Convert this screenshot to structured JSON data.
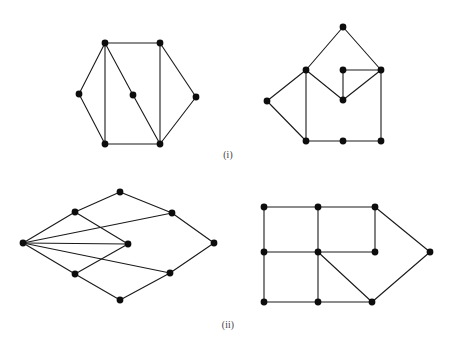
{
  "figure": {
    "background_color": "#ffffff",
    "edge_color": "#1a1a1a",
    "vertex_color": "#0d0d0d",
    "edge_width": 1.1,
    "vertex_radius": 3.4,
    "captions": {
      "first": "(i)",
      "second": "(ii)"
    }
  },
  "chart_data": {
    "type": "diagram",
    "title": "",
    "graphs": [
      {
        "id": "graph-i-left",
        "row": "i",
        "position": "left",
        "name": "hexagon-with-central-vertex",
        "vertex_count": 7,
        "edge_count": 10,
        "vertices": [
          {
            "id": "v1",
            "x": 105,
            "y": 43
          },
          {
            "id": "v2",
            "x": 160,
            "y": 43
          },
          {
            "id": "v3",
            "x": 196,
            "y": 97
          },
          {
            "id": "v4",
            "x": 160,
            "y": 144
          },
          {
            "id": "v5",
            "x": 105,
            "y": 144
          },
          {
            "id": "v6",
            "x": 79,
            "y": 94
          },
          {
            "id": "v7",
            "x": 133,
            "y": 95
          }
        ],
        "edges": [
          [
            "v1",
            "v2"
          ],
          [
            "v2",
            "v3"
          ],
          [
            "v3",
            "v4"
          ],
          [
            "v4",
            "v5"
          ],
          [
            "v5",
            "v6"
          ],
          [
            "v6",
            "v1"
          ],
          [
            "v1",
            "v5"
          ],
          [
            "v2",
            "v4"
          ],
          [
            "v1",
            "v7"
          ],
          [
            "v7",
            "v4"
          ]
        ]
      },
      {
        "id": "graph-i-right",
        "row": "i",
        "position": "right",
        "name": "tilted-square-with-interior-vee",
        "vertex_count": 8,
        "edge_count": 11,
        "vertices": [
          {
            "id": "w1",
            "x": 343,
            "y": 27
          },
          {
            "id": "w2",
            "x": 306,
            "y": 70
          },
          {
            "id": "w3",
            "x": 267,
            "y": 101
          },
          {
            "id": "w4",
            "x": 306,
            "y": 141
          },
          {
            "id": "w5",
            "x": 343,
            "y": 141
          },
          {
            "id": "w6",
            "x": 381,
            "y": 141
          },
          {
            "id": "w7",
            "x": 381,
            "y": 70
          },
          {
            "id": "w8",
            "x": 343,
            "y": 100
          },
          {
            "id": "w9",
            "x": 343,
            "y": 70
          }
        ],
        "edges": [
          [
            "w1",
            "w2"
          ],
          [
            "w1",
            "w7"
          ],
          [
            "w2",
            "w3"
          ],
          [
            "w3",
            "w4"
          ],
          [
            "w2",
            "w4"
          ],
          [
            "w4",
            "w5"
          ],
          [
            "w5",
            "w6"
          ],
          [
            "w6",
            "w7"
          ],
          [
            "w2",
            "w8"
          ],
          [
            "w8",
            "w7"
          ],
          [
            "w8",
            "w9"
          ],
          [
            "w9",
            "w7"
          ]
        ]
      },
      {
        "id": "graph-ii-left",
        "row": "ii",
        "position": "left",
        "name": "fan-diamond-with-left-hub",
        "vertex_count": 8,
        "edge_count": 12,
        "vertices": [
          {
            "id": "u1",
            "x": 23,
            "y": 243
          },
          {
            "id": "u2",
            "x": 75,
            "y": 212
          },
          {
            "id": "u3",
            "x": 120,
            "y": 192
          },
          {
            "id": "u4",
            "x": 172,
            "y": 213
          },
          {
            "id": "u5",
            "x": 214,
            "y": 243
          },
          {
            "id": "u6",
            "x": 170,
            "y": 273
          },
          {
            "id": "u7",
            "x": 120,
            "y": 300
          },
          {
            "id": "u8",
            "x": 75,
            "y": 274
          },
          {
            "id": "u9",
            "x": 128,
            "y": 244
          }
        ],
        "edges": [
          [
            "u1",
            "u2"
          ],
          [
            "u2",
            "u3"
          ],
          [
            "u3",
            "u4"
          ],
          [
            "u4",
            "u5"
          ],
          [
            "u5",
            "u6"
          ],
          [
            "u6",
            "u7"
          ],
          [
            "u7",
            "u8"
          ],
          [
            "u8",
            "u1"
          ],
          [
            "u1",
            "u9"
          ],
          [
            "u1",
            "u4"
          ],
          [
            "u1",
            "u6"
          ],
          [
            "u2",
            "u9"
          ],
          [
            "u8",
            "u9"
          ]
        ]
      },
      {
        "id": "graph-ii-right",
        "row": "ii",
        "position": "right",
        "name": "grid-with-triangular-extension",
        "vertex_count": 10,
        "edge_count": 14,
        "vertices": [
          {
            "id": "g1",
            "x": 264,
            "y": 207
          },
          {
            "id": "g2",
            "x": 318,
            "y": 207
          },
          {
            "id": "g3",
            "x": 375,
            "y": 207
          },
          {
            "id": "g4",
            "x": 264,
            "y": 252
          },
          {
            "id": "g5",
            "x": 318,
            "y": 252
          },
          {
            "id": "g6",
            "x": 375,
            "y": 252
          },
          {
            "id": "g7",
            "x": 264,
            "y": 302
          },
          {
            "id": "g8",
            "x": 318,
            "y": 302
          },
          {
            "id": "g9",
            "x": 372,
            "y": 302
          },
          {
            "id": "g10",
            "x": 430,
            "y": 252
          }
        ],
        "edges": [
          [
            "g1",
            "g2"
          ],
          [
            "g2",
            "g3"
          ],
          [
            "g1",
            "g4"
          ],
          [
            "g2",
            "g5"
          ],
          [
            "g3",
            "g6"
          ],
          [
            "g4",
            "g5"
          ],
          [
            "g5",
            "g6"
          ],
          [
            "g4",
            "g7"
          ],
          [
            "g5",
            "g8"
          ],
          [
            "g7",
            "g8"
          ],
          [
            "g8",
            "g9"
          ],
          [
            "g5",
            "g9"
          ],
          [
            "g3",
            "g10"
          ],
          [
            "g9",
            "g10"
          ]
        ]
      }
    ]
  }
}
